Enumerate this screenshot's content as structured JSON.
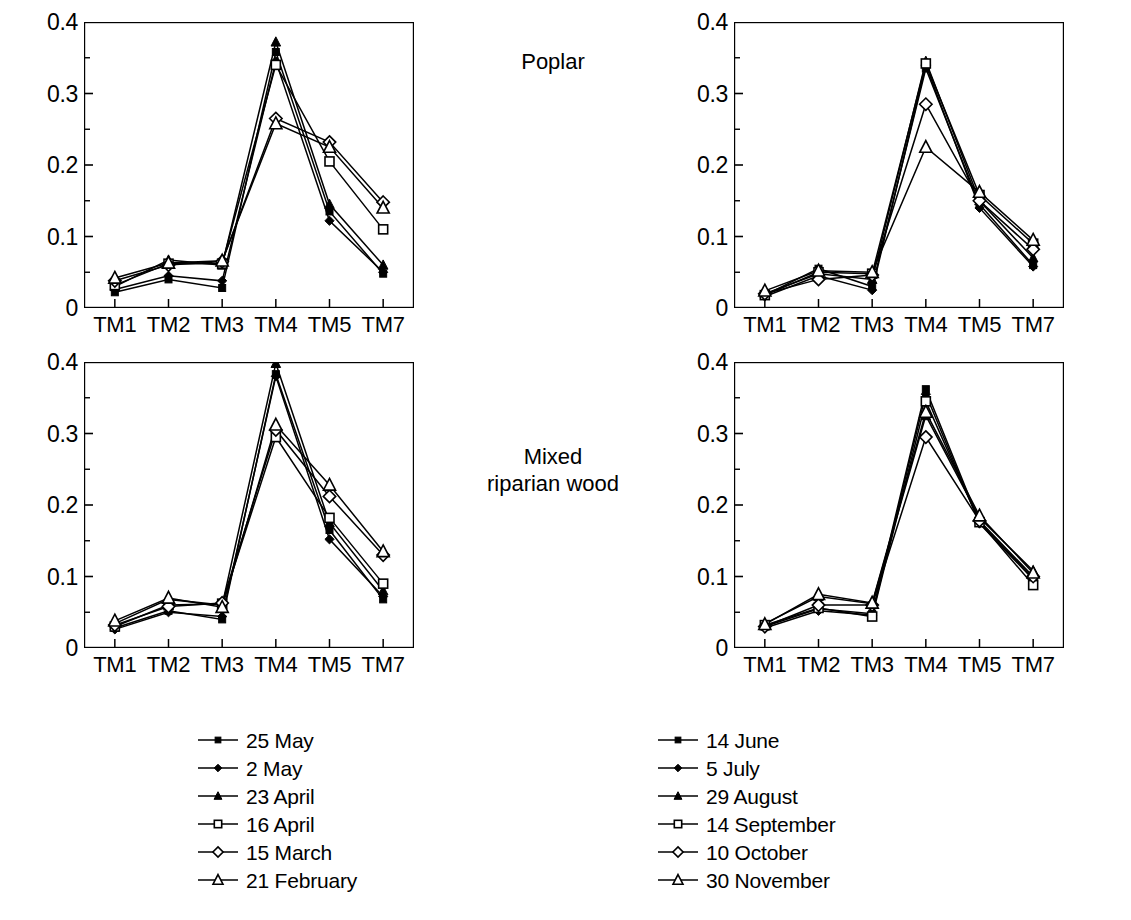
{
  "panels": {
    "poplar_title": "Poplar",
    "mixed_title": "Mixed\nriparian wood"
  },
  "axis": {
    "y_ticks": [
      "0.4",
      "0.3",
      "0.2",
      "0.1",
      "0"
    ],
    "y_values": [
      0.4,
      0.3,
      0.2,
      0.1,
      0
    ],
    "x_ticks": [
      "TM1",
      "TM2",
      "TM3",
      "TM4",
      "TM5",
      "TM7"
    ]
  },
  "legend_left": [
    {
      "label": "25 May",
      "marker": "filled-square"
    },
    {
      "label": "2 May",
      "marker": "filled-diamond"
    },
    {
      "label": "23 April",
      "marker": "filled-triangle"
    },
    {
      "label": "16 April",
      "marker": "open-square"
    },
    {
      "label": "15 March",
      "marker": "open-diamond"
    },
    {
      "label": "21 February",
      "marker": "open-triangle"
    }
  ],
  "legend_right": [
    {
      "label": "14 June",
      "marker": "filled-square"
    },
    {
      "label": "5 July",
      "marker": "filled-diamond"
    },
    {
      "label": "29 August",
      "marker": "filled-triangle"
    },
    {
      "label": "14 September",
      "marker": "open-square"
    },
    {
      "label": "10 October",
      "marker": "open-diamond"
    },
    {
      "label": "30 November",
      "marker": "open-triangle"
    }
  ],
  "caption": "",
  "chart_data": [
    {
      "id": "poplar-spring",
      "type": "line",
      "title": "Poplar",
      "position": "top-left",
      "xlabel": "",
      "ylabel": "",
      "categories": [
        "TM1",
        "TM2",
        "TM3",
        "TM4",
        "TM5",
        "TM7"
      ],
      "ylim": [
        0,
        0.4
      ],
      "y_ticks": [
        0,
        0.1,
        0.2,
        0.3,
        0.4
      ],
      "grid": false,
      "legend_position": "below-center",
      "series": [
        {
          "name": "25 May",
          "marker": "filled-square",
          "values": [
            0.022,
            0.04,
            0.028,
            0.358,
            0.135,
            0.048
          ]
        },
        {
          "name": "2 May",
          "marker": "filled-diamond",
          "values": [
            0.026,
            0.045,
            0.038,
            0.345,
            0.122,
            0.05
          ]
        },
        {
          "name": "23 April",
          "marker": "filled-triangle",
          "values": [
            0.03,
            0.067,
            0.06,
            0.372,
            0.145,
            0.06
          ]
        },
        {
          "name": "16 April",
          "marker": "open-square",
          "values": [
            0.032,
            0.062,
            0.062,
            0.34,
            0.205,
            0.11
          ]
        },
        {
          "name": "15 March",
          "marker": "open-diamond",
          "values": [
            0.038,
            0.06,
            0.065,
            0.265,
            0.232,
            0.148
          ]
        },
        {
          "name": "21 February",
          "marker": "open-triangle",
          "values": [
            0.042,
            0.063,
            0.066,
            0.258,
            0.225,
            0.14
          ]
        }
      ]
    },
    {
      "id": "poplar-summer-autumn",
      "type": "line",
      "title": "Poplar",
      "position": "top-right",
      "xlabel": "",
      "ylabel": "",
      "categories": [
        "TM1",
        "TM2",
        "TM3",
        "TM4",
        "TM5",
        "TM7"
      ],
      "ylim": [
        0,
        0.4
      ],
      "y_ticks": [
        0,
        0.1,
        0.2,
        0.3,
        0.4
      ],
      "grid": false,
      "legend_position": "below-center",
      "series": [
        {
          "name": "14 June",
          "marker": "filled-square",
          "values": [
            0.018,
            0.055,
            0.03,
            0.335,
            0.145,
            0.06
          ]
        },
        {
          "name": "5 July",
          "marker": "filled-diamond",
          "values": [
            0.016,
            0.045,
            0.025,
            0.34,
            0.14,
            0.058
          ]
        },
        {
          "name": "29 August",
          "marker": "filled-triangle",
          "values": [
            0.02,
            0.048,
            0.04,
            0.345,
            0.15,
            0.07
          ]
        },
        {
          "name": "14 September",
          "marker": "open-square",
          "values": [
            0.018,
            0.05,
            0.048,
            0.342,
            0.158,
            0.09
          ]
        },
        {
          "name": "10 October",
          "marker": "open-diamond",
          "values": [
            0.02,
            0.04,
            0.046,
            0.285,
            0.15,
            0.082
          ]
        },
        {
          "name": "30 November",
          "marker": "open-triangle",
          "values": [
            0.024,
            0.052,
            0.05,
            0.225,
            0.162,
            0.095
          ]
        }
      ]
    },
    {
      "id": "mixed-spring",
      "type": "line",
      "title": "Mixed riparian wood",
      "position": "bottom-left",
      "xlabel": "",
      "ylabel": "",
      "categories": [
        "TM1",
        "TM2",
        "TM3",
        "TM4",
        "TM5",
        "TM7"
      ],
      "ylim": [
        0,
        0.4
      ],
      "y_ticks": [
        0,
        0.1,
        0.2,
        0.3,
        0.4
      ],
      "grid": false,
      "legend_position": "below-center",
      "series": [
        {
          "name": "25 May",
          "marker": "filled-square",
          "values": [
            0.028,
            0.052,
            0.04,
            0.383,
            0.165,
            0.068
          ]
        },
        {
          "name": "2 May",
          "marker": "filled-diamond",
          "values": [
            0.026,
            0.05,
            0.044,
            0.38,
            0.152,
            0.072
          ]
        },
        {
          "name": "23 April",
          "marker": "filled-triangle",
          "values": [
            0.034,
            0.068,
            0.06,
            0.398,
            0.175,
            0.08
          ]
        },
        {
          "name": "16 April",
          "marker": "open-square",
          "values": [
            0.03,
            0.06,
            0.062,
            0.295,
            0.182,
            0.09
          ]
        },
        {
          "name": "15 March",
          "marker": "open-diamond",
          "values": [
            0.032,
            0.058,
            0.063,
            0.305,
            0.212,
            0.13
          ]
        },
        {
          "name": "21 February",
          "marker": "open-triangle",
          "values": [
            0.038,
            0.07,
            0.057,
            0.312,
            0.228,
            0.135
          ]
        }
      ]
    },
    {
      "id": "mixed-summer-autumn",
      "type": "line",
      "title": "Mixed riparian wood",
      "position": "bottom-right",
      "xlabel": "",
      "ylabel": "",
      "categories": [
        "TM1",
        "TM2",
        "TM3",
        "TM4",
        "TM5",
        "TM7"
      ],
      "ylim": [
        0,
        0.4
      ],
      "y_ticks": [
        0,
        0.1,
        0.2,
        0.3,
        0.4
      ],
      "grid": false,
      "legend_position": "below-center",
      "series": [
        {
          "name": "14 June",
          "marker": "filled-square",
          "values": [
            0.03,
            0.055,
            0.048,
            0.362,
            0.176,
            0.098
          ]
        },
        {
          "name": "5 July",
          "marker": "filled-diamond",
          "values": [
            0.028,
            0.052,
            0.046,
            0.355,
            0.174,
            0.096
          ]
        },
        {
          "name": "29 August",
          "marker": "filled-triangle",
          "values": [
            0.034,
            0.072,
            0.062,
            0.325,
            0.182,
            0.108
          ]
        },
        {
          "name": "14 September",
          "marker": "open-square",
          "values": [
            0.032,
            0.056,
            0.044,
            0.345,
            0.176,
            0.088
          ]
        },
        {
          "name": "10 October",
          "marker": "open-diamond",
          "values": [
            0.03,
            0.06,
            0.06,
            0.295,
            0.178,
            0.1
          ]
        },
        {
          "name": "30 November",
          "marker": "open-triangle",
          "values": [
            0.033,
            0.075,
            0.063,
            0.33,
            0.185,
            0.105
          ]
        }
      ]
    }
  ]
}
